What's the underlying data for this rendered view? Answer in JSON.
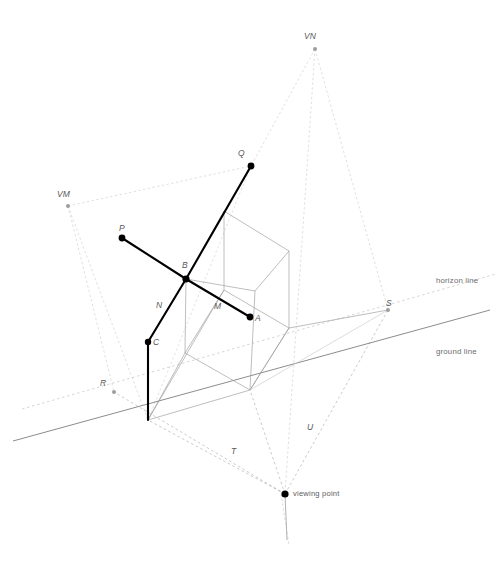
{
  "figure": {
    "type": "perspective-construction-diagram",
    "title_visible": false,
    "background_color": "#ffffff"
  },
  "colors": {
    "solid_black": "#000000",
    "thin_gray": "#808080",
    "light_gray": "#b4b4b4",
    "very_light_gray": "#c8c8c8",
    "label_gray": "#59595b",
    "dot_black": "#000000"
  },
  "labels": {
    "vm": "VM",
    "vn": "VN",
    "p": "P",
    "q": "Q",
    "a": "A",
    "b": "B",
    "c": "C",
    "m": "M",
    "n": "N",
    "r": "R",
    "s": "S",
    "t": "T",
    "u": "U",
    "horizon_line": "horizon line",
    "ground_line": "ground line",
    "viewing_point": "viewing point"
  },
  "points": {
    "vm": {
      "label": "VM",
      "x": 68,
      "y": 206,
      "dot": "small-gray"
    },
    "vn": {
      "label": "VN",
      "x": 315,
      "y": 49,
      "dot": "small-gray"
    },
    "p": {
      "label": "P",
      "x": 122,
      "y": 238,
      "dot": "large-black"
    },
    "q": {
      "label": "Q",
      "x": 251,
      "y": 166,
      "dot": "large-black"
    },
    "a": {
      "label": "A",
      "x": 250,
      "y": 317,
      "dot": "large-black"
    },
    "b": {
      "label": "B",
      "x": 186,
      "y": 279,
      "dot": "large-black"
    },
    "c": {
      "label": "C",
      "x": 148,
      "y": 342,
      "dot": "large-black"
    },
    "r": {
      "label": "R",
      "x": 114,
      "y": 392,
      "dot": "small-gray"
    },
    "s": {
      "label": "S",
      "x": 388,
      "y": 310,
      "dot": "small-gray"
    },
    "viewing_point": {
      "label": "viewing point",
      "x": 285,
      "y": 494,
      "dot": "large-black"
    }
  },
  "label_positions": {
    "vm": {
      "x": 57,
      "y": 190
    },
    "vn": {
      "x": 304,
      "y": 32
    },
    "p": {
      "x": 119,
      "y": 224
    },
    "q": {
      "x": 238,
      "y": 150
    },
    "a": {
      "x": 255,
      "y": 315
    },
    "b": {
      "x": 182,
      "y": 261
    },
    "c": {
      "x": 153,
      "y": 339
    },
    "m": {
      "x": 214,
      "y": 302
    },
    "n": {
      "x": 156,
      "y": 301
    },
    "r": {
      "x": 101,
      "y": 379
    },
    "s": {
      "x": 386,
      "y": 300
    },
    "t": {
      "x": 231,
      "y": 448
    },
    "u": {
      "x": 308,
      "y": 424
    },
    "horizon_line": {
      "x": 436,
      "y": 277
    },
    "ground_line": {
      "x": 436,
      "y": 348
    },
    "viewing_point": {
      "x": 293,
      "y": 490
    }
  },
  "reference_lines": {
    "horizon_line": {
      "from": {
        "x": 22,
        "y": 408
      },
      "to": {
        "x": 494,
        "y": 275
      },
      "style": "dashed",
      "color": "#c0c0c0"
    },
    "ground_line": {
      "from": {
        "x": 14,
        "y": 440
      },
      "to": {
        "x": 488,
        "y": 311
      },
      "style": "solid",
      "color": "#6a6a6a"
    }
  },
  "geometry": {
    "box_vertices": {
      "top_back_left": {
        "x": 224,
        "y": 211
      },
      "top_back_right": {
        "x": 289,
        "y": 251
      },
      "top_front_left": {
        "x": 186,
        "y": 279
      },
      "top_front_right": {
        "x": 255,
        "y": 291
      },
      "bot_back_left": {
        "x": 224,
        "y": 290
      },
      "bot_back_right": {
        "x": 289,
        "y": 328
      },
      "bot_front_left": {
        "x": 185,
        "y": 353
      },
      "bot_front_right": {
        "x": 250,
        "y": 390
      }
    },
    "segments": {
      "p_to_b": {
        "from": "p",
        "to": "b",
        "weight": "thick"
      },
      "b_to_c": {
        "from": "b",
        "to": "c",
        "weight": "thick"
      },
      "c_vertical": {
        "from": {
          "x": 148,
          "y": 342
        },
        "to": {
          "x": 148,
          "y": 420
        },
        "weight": "thick"
      },
      "q_to_b": {
        "from": "q",
        "to": "b",
        "weight": "thick"
      },
      "b_to_a": {
        "from": "b",
        "to": "a",
        "weight": "thick"
      }
    }
  },
  "annotations": {
    "n_on_segment": "N",
    "m_on_segment": "M",
    "t_on_ray": "T",
    "u_on_ray": "U"
  }
}
